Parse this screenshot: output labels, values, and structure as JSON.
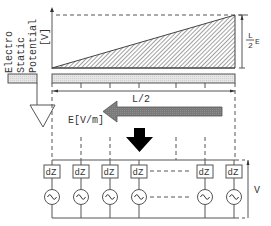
{
  "potential_plot": {
    "ylabel_lines": [
      "Electro",
      "Static",
      "Potential",
      "[V]"
    ],
    "height_label_num": "L",
    "height_label_den": "2",
    "height_label_suffix": "E"
  },
  "electrode": {
    "length_label": "L/2"
  },
  "field": {
    "label": "E[V/m]",
    "arrow_color": "#777777"
  },
  "circuit": {
    "element_label": "dZ",
    "columns": [
      {
        "impedance": "dZ",
        "source": "ac-source"
      },
      {
        "impedance": "dZ",
        "source": "ac-source"
      },
      {
        "impedance": "dZ",
        "source": "ac-source"
      },
      {
        "impedance": "dZ",
        "source": "ac-source"
      },
      {
        "impedance": "dZ",
        "source": "ac-source"
      },
      {
        "impedance": "dZ",
        "source": "ac-source"
      }
    ],
    "voltage_label": "V"
  },
  "colors": {
    "line": "#555555",
    "hatch": "#444444",
    "electrode_fill": "#e4e4e4",
    "field_arrow": "#777777",
    "down_arrow": "#000000"
  }
}
